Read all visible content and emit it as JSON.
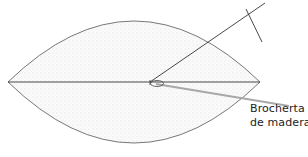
{
  "diagram": {
    "label": {
      "line1": "Brocherta",
      "line2": "de madera"
    },
    "colors": {
      "outline": "#555555",
      "fill": "#f1f1f1",
      "skewer": "#a8a8a8",
      "line": "#333333"
    }
  }
}
